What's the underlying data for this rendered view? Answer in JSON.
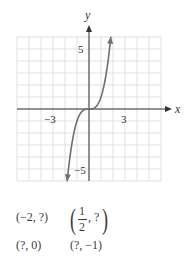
{
  "chart_data": {
    "type": "line",
    "title": "",
    "xlabel": "x",
    "ylabel": "y",
    "xlim": [
      -6,
      6
    ],
    "ylim": [
      -6,
      6
    ],
    "grid": true,
    "x_ticks_labeled": [
      {
        "value": -3,
        "label": "−3"
      },
      {
        "value": 3,
        "label": "3"
      }
    ],
    "y_ticks_labeled": [
      {
        "value": 5,
        "label": "5"
      },
      {
        "value": -5,
        "label": "−5"
      }
    ],
    "series": [
      {
        "name": "y = x^3",
        "function": "x^3",
        "x_range": [
          -1.82,
          1.82
        ],
        "arrows_both_ends": true,
        "points": [
          [
            -1.82,
            -6.03
          ],
          [
            -1.6,
            -4.1
          ],
          [
            -1.4,
            -2.74
          ],
          [
            -1.2,
            -1.73
          ],
          [
            -1.0,
            -1.0
          ],
          [
            -0.8,
            -0.51
          ],
          [
            -0.6,
            -0.22
          ],
          [
            -0.4,
            -0.06
          ],
          [
            0,
            0
          ],
          [
            0.4,
            0.06
          ],
          [
            0.6,
            0.22
          ],
          [
            0.8,
            0.51
          ],
          [
            1.0,
            1.0
          ],
          [
            1.2,
            1.73
          ],
          [
            1.4,
            2.74
          ],
          [
            1.6,
            4.1
          ],
          [
            1.82,
            6.03
          ]
        ]
      }
    ],
    "colors": {
      "curve": "#6e6e6e",
      "axes": "#333333",
      "grid": "#d9d9d9"
    }
  },
  "questions": {
    "q1": "(−2, ?)",
    "q2_num": "1",
    "q2_den": "2",
    "q2_rest": ", ?",
    "q3": "(?, 0)",
    "q4": "(?, −1)"
  },
  "labels": {
    "x_axis": "x",
    "y_axis": "y",
    "tick_neg3": "−3",
    "tick_3": "3",
    "tick_5": "5",
    "tick_neg5": "−5"
  }
}
